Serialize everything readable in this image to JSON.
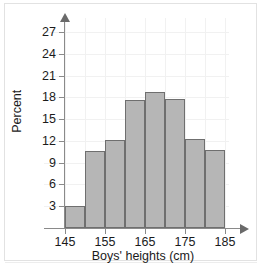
{
  "chart_data": {
    "type": "bar",
    "title": "",
    "subtitle": "",
    "xlabel": "Boys' heights (cm)",
    "ylabel": "Percent",
    "categories": [
      "145-150",
      "150-155",
      "155-160",
      "160-165",
      "165-170",
      "170-175",
      "175-180",
      "180-185"
    ],
    "bin_edges": [
      145,
      150,
      155,
      160,
      165,
      170,
      175,
      180,
      185
    ],
    "values": [
      3.0,
      10.6,
      12.1,
      17.7,
      18.7,
      17.8,
      12.2,
      10.7
    ],
    "xtick_labels": [
      "145",
      "155",
      "165",
      "175",
      "185"
    ],
    "xticks": [
      145,
      155,
      165,
      175,
      185
    ],
    "ytick_labels": [
      "3",
      "6",
      "9",
      "12",
      "15",
      "18",
      "21",
      "24",
      "27"
    ],
    "yticks": [
      3,
      6,
      9,
      12,
      15,
      18,
      21,
      24,
      27
    ],
    "xlim": [
      143,
      187
    ],
    "ylim": [
      0,
      28.5
    ],
    "grid": true,
    "legend": false,
    "legend_position": "none",
    "bar_fill_color": "#b6b6b6",
    "bar_edge_color": "#6f6f6f",
    "axis_color": "#8a8a8a",
    "grid_color": "#f1f1f1",
    "text_color": "#1b1b1b",
    "background_color": "#ffffff"
  }
}
